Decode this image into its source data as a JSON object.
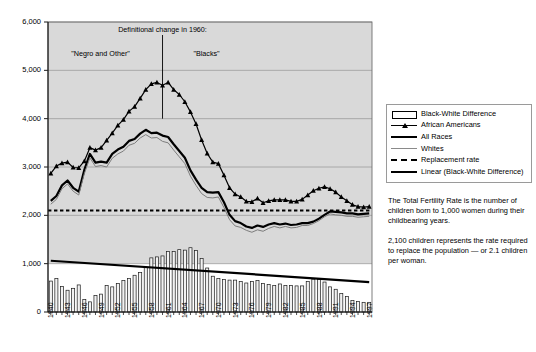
{
  "chart_data": {
    "type": "line",
    "title": "",
    "xlabel": "",
    "ylabel": "",
    "ylim": [
      0,
      6000
    ],
    "ytick_labels": [
      "0",
      "1,000",
      "2,000",
      "3,000",
      "4,000",
      "5,000",
      "6,000"
    ],
    "yticks": [
      0,
      1000,
      2000,
      3000,
      4000,
      5000,
      6000
    ],
    "grid": true,
    "legend_position": "right",
    "x": [
      1940,
      1941,
      1942,
      1943,
      1944,
      1945,
      1946,
      1947,
      1948,
      1949,
      1950,
      1951,
      1952,
      1953,
      1954,
      1955,
      1956,
      1957,
      1958,
      1959,
      1960,
      1961,
      1962,
      1963,
      1964,
      1965,
      1966,
      1967,
      1968,
      1969,
      1970,
      1971,
      1972,
      1973,
      1974,
      1975,
      1976,
      1977,
      1978,
      1979,
      1980,
      1981,
      1982,
      1983,
      1984,
      1985,
      1986,
      1987,
      1988,
      1989,
      1990,
      1991,
      1992,
      1993,
      1994,
      1995,
      1996,
      1997
    ],
    "xtick_labels": [
      "1940",
      "1943",
      "1946",
      "1949",
      "1952",
      "1955",
      "1958",
      "1961",
      "1964",
      "1967",
      "1970",
      "1973",
      "1976",
      "1979",
      "1982",
      "1985",
      "1988",
      "1991",
      "1994",
      "1997"
    ],
    "xtick_step": 3,
    "series": [
      {
        "name": "African Americans",
        "style": "line-marker-triangle",
        "color": "#000000",
        "values": [
          2870,
          3020,
          3080,
          3100,
          2990,
          2980,
          3120,
          3400,
          3350,
          3400,
          3550,
          3700,
          3860,
          3980,
          4150,
          4250,
          4420,
          4600,
          4720,
          4750,
          4690,
          4750,
          4600,
          4500,
          4350,
          4140,
          3890,
          3560,
          3280,
          3100,
          3070,
          2830,
          2570,
          2440,
          2380,
          2290,
          2280,
          2350,
          2260,
          2300,
          2320,
          2320,
          2320,
          2290,
          2290,
          2330,
          2420,
          2510,
          2560,
          2590,
          2550,
          2480,
          2380,
          2300,
          2220,
          2180,
          2170,
          2180
        ]
      },
      {
        "name": "All Races",
        "style": "line-thick",
        "color": "#000000",
        "values": [
          2300,
          2400,
          2620,
          2720,
          2570,
          2490,
          2940,
          3270,
          3090,
          3110,
          3090,
          3270,
          3360,
          3420,
          3540,
          3580,
          3690,
          3770,
          3700,
          3710,
          3650,
          3620,
          3470,
          3330,
          3190,
          2930,
          2740,
          2570,
          2480,
          2470,
          2480,
          2270,
          2010,
          1880,
          1840,
          1770,
          1740,
          1790,
          1760,
          1810,
          1840,
          1810,
          1830,
          1800,
          1810,
          1840,
          1840,
          1870,
          1930,
          2010,
          2080,
          2070,
          2060,
          2040,
          2040,
          2020,
          2030,
          2040
        ]
      },
      {
        "name": "Whites",
        "style": "line-thin",
        "color": "#7d7d7d",
        "values": [
          2230,
          2330,
          2550,
          2650,
          2500,
          2420,
          2860,
          3190,
          3010,
          3030,
          3000,
          3180,
          3270,
          3330,
          3450,
          3490,
          3600,
          3670,
          3600,
          3610,
          3530,
          3500,
          3350,
          3210,
          3070,
          2810,
          2620,
          2450,
          2370,
          2360,
          2380,
          2160,
          1910,
          1780,
          1750,
          1690,
          1650,
          1700,
          1670,
          1730,
          1770,
          1740,
          1770,
          1740,
          1750,
          1790,
          1790,
          1830,
          1890,
          1970,
          2030,
          2010,
          2000,
          1980,
          1980,
          1960,
          1970,
          1980
        ]
      }
    ],
    "bar_series": {
      "name": "Black-White Difference",
      "values": [
        640,
        690,
        530,
        450,
        490,
        560,
        260,
        210,
        340,
        370,
        550,
        520,
        590,
        650,
        690,
        760,
        820,
        930,
        1120,
        1140,
        1160,
        1250,
        1250,
        1290,
        1280,
        1330,
        1270,
        1110,
        910,
        740,
        690,
        670,
        660,
        660,
        630,
        600,
        630,
        650,
        590,
        570,
        550,
        580,
        550,
        550,
        540,
        540,
        630,
        680,
        670,
        620,
        520,
        470,
        380,
        320,
        240,
        220,
        200,
        200
      ]
    },
    "replacement_rate": {
      "name": "Replacement rate",
      "value": 2100,
      "style": "dashed"
    },
    "trend_line": {
      "name": "Linear (Black-White Difference)",
      "start_value": 1060,
      "end_value": 620,
      "style": "line-thick"
    },
    "annotations": {
      "headline": "Definitional change in 1960:",
      "left_label": "\"Negro and Other\"",
      "right_label": "\"Blacks\"",
      "divider_year": 1960
    }
  },
  "legend": {
    "items": [
      {
        "label": "Black-White Difference",
        "key": "bar"
      },
      {
        "label": "African Americans",
        "key": "triangle"
      },
      {
        "label": "All Races",
        "key": "thick"
      },
      {
        "label": "Whites",
        "key": "thin"
      },
      {
        "label": "Replacement rate",
        "key": "dash"
      },
      {
        "label": "Linear (Black-White Difference)",
        "key": "thick"
      }
    ]
  },
  "note": {
    "paragraph1": "The Total Fertility Rate is the number of children born to 1,000 women during their childbearing years.",
    "paragraph2": "2,100 children represents the rate required to replace the population — or 2.1 children per woman."
  }
}
